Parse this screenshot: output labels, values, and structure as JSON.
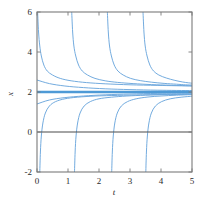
{
  "chart_data": {
    "type": "line",
    "title": "",
    "subtitle": "",
    "xlabel": "t",
    "ylabel": "x",
    "xlim": [
      0,
      5
    ],
    "ylim": [
      -2,
      6
    ],
    "grid": false,
    "legend": "none",
    "x_ticks": [
      0,
      1,
      2,
      3,
      4,
      5
    ],
    "x_tick_labels": [
      "0",
      "1",
      "2",
      "3",
      "4",
      "5"
    ],
    "y_ticks": [
      -2,
      0,
      2,
      4,
      6
    ],
    "y_tick_labels": [
      "-2",
      "0",
      "2",
      "4",
      "6"
    ],
    "curve_color": "#6CA6DC",
    "equilibrium_color": "#4E9AD6",
    "axis_color": "#4a4a4a",
    "frame_color": "#7a7a7a",
    "equilibrium": {
      "name": "equilibrium-solution",
      "value": 2,
      "label": "x = 2",
      "emphasis": "thick"
    },
    "zero_line": {
      "name": "zero-axis-line",
      "value": 0
    },
    "series": [
      {
        "name": "upper-branch-1",
        "region": "above-equilibrium",
        "asymptote_t": 0.0,
        "x": [
          0.02,
          0.05,
          0.09,
          0.14,
          0.22,
          0.33,
          0.5,
          0.75,
          1.1,
          1.6,
          2.2,
          3.0,
          3.9,
          5.0
        ],
        "y": [
          6.0,
          5.0,
          4.3,
          3.8,
          3.35,
          3.05,
          2.85,
          2.68,
          2.56,
          2.47,
          2.41,
          2.36,
          2.33,
          2.3
        ]
      },
      {
        "name": "upper-branch-2",
        "region": "above-equilibrium",
        "asymptote_t": 1.1,
        "x": [
          1.12,
          1.15,
          1.19,
          1.25,
          1.34,
          1.46,
          1.63,
          1.87,
          2.2,
          2.6,
          3.1,
          3.7,
          4.3,
          5.0
        ],
        "y": [
          6.0,
          5.0,
          4.3,
          3.8,
          3.35,
          3.05,
          2.85,
          2.68,
          2.56,
          2.48,
          2.42,
          2.37,
          2.34,
          2.31
        ]
      },
      {
        "name": "upper-branch-3",
        "region": "above-equilibrium",
        "asymptote_t": 2.25,
        "x": [
          2.27,
          2.3,
          2.34,
          2.4,
          2.49,
          2.61,
          2.78,
          3.02,
          3.33,
          3.7,
          4.1,
          4.5,
          4.78,
          5.0
        ],
        "y": [
          6.0,
          5.0,
          4.3,
          3.8,
          3.35,
          3.05,
          2.85,
          2.68,
          2.57,
          2.49,
          2.43,
          2.39,
          2.36,
          2.35
        ]
      },
      {
        "name": "upper-branch-4",
        "region": "above-equilibrium",
        "asymptote_t": 3.4,
        "x": [
          3.42,
          3.45,
          3.49,
          3.55,
          3.64,
          3.76,
          3.93,
          4.17,
          4.45,
          4.7,
          4.88,
          5.0
        ],
        "y": [
          6.0,
          5.0,
          4.3,
          3.8,
          3.35,
          3.05,
          2.85,
          2.7,
          2.58,
          2.5,
          2.46,
          2.44
        ]
      },
      {
        "name": "lower-branch-1",
        "region": "below-equilibrium",
        "asymptote_t": 0.08,
        "x": [
          0.09,
          0.11,
          0.14,
          0.19,
          0.27,
          0.4,
          0.6,
          0.9,
          1.3,
          1.9,
          2.6,
          3.4,
          4.2,
          5.0
        ],
        "y": [
          -2.0,
          -1.0,
          -0.2,
          0.45,
          0.95,
          1.3,
          1.52,
          1.66,
          1.74,
          1.8,
          1.83,
          1.86,
          1.88,
          1.89
        ]
      },
      {
        "name": "lower-branch-2",
        "region": "below-equilibrium",
        "asymptote_t": 1.2,
        "x": [
          1.21,
          1.23,
          1.26,
          1.31,
          1.39,
          1.52,
          1.72,
          2.0,
          2.4,
          2.9,
          3.5,
          4.2,
          5.0
        ],
        "y": [
          -2.0,
          -1.0,
          -0.2,
          0.45,
          0.95,
          1.3,
          1.52,
          1.66,
          1.74,
          1.8,
          1.84,
          1.87,
          1.89
        ]
      },
      {
        "name": "lower-branch-3",
        "region": "below-equilibrium",
        "asymptote_t": 2.4,
        "x": [
          2.41,
          2.43,
          2.46,
          2.51,
          2.59,
          2.72,
          2.92,
          3.2,
          3.58,
          4.0,
          4.5,
          5.0
        ],
        "y": [
          -2.0,
          -1.0,
          -0.2,
          0.45,
          0.95,
          1.3,
          1.52,
          1.66,
          1.75,
          1.8,
          1.84,
          1.87
        ]
      },
      {
        "name": "lower-branch-4",
        "region": "below-equilibrium",
        "asymptote_t": 3.5,
        "x": [
          3.51,
          3.53,
          3.56,
          3.61,
          3.69,
          3.82,
          4.02,
          4.3,
          4.65,
          5.0
        ],
        "y": [
          -2.0,
          -1.0,
          -0.2,
          0.45,
          0.95,
          1.3,
          1.52,
          1.66,
          1.74,
          1.79
        ]
      },
      {
        "name": "near-equilibrium-above",
        "region": "above-equilibrium",
        "asymptote_t": null,
        "x": [
          0.0,
          0.4,
          0.9,
          1.5,
          2.2,
          3.0,
          3.9,
          5.0
        ],
        "y": [
          2.6,
          2.42,
          2.3,
          2.22,
          2.16,
          2.12,
          2.09,
          2.07
        ]
      },
      {
        "name": "near-equilibrium-below",
        "region": "below-equilibrium",
        "asymptote_t": null,
        "x": [
          0.0,
          0.4,
          0.9,
          1.5,
          2.2,
          3.0,
          3.9,
          5.0
        ],
        "y": [
          1.4,
          1.6,
          1.72,
          1.8,
          1.86,
          1.9,
          1.93,
          1.94
        ]
      }
    ]
  }
}
